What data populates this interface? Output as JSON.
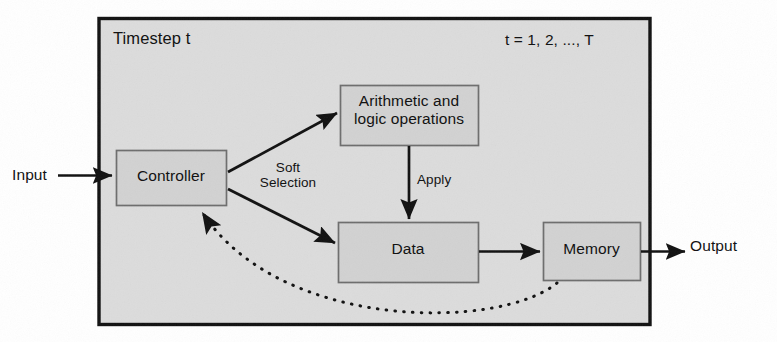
{
  "figure": {
    "title_label": "Timestep t",
    "range_label": "t = 1, 2, ..., T",
    "external": {
      "input_label": "Input",
      "output_label": "Output"
    },
    "nodes": [
      {
        "id": "controller",
        "label": "Controller"
      },
      {
        "id": "alu",
        "label": "Arithmetic and\nlogic operations"
      },
      {
        "id": "data",
        "label": "Data"
      },
      {
        "id": "memory",
        "label": "Memory"
      }
    ],
    "edge_labels": {
      "soft_selection": "Soft\nSelection",
      "apply": "Apply"
    },
    "colors": {
      "panel_fill": "#dcdcdc",
      "panel_border": "#111111",
      "node_fill": "#d2d2d2",
      "node_border": "#6d6d6d",
      "arrow": "#101010",
      "text": "#131313",
      "page_background": "#ffffff"
    }
  }
}
